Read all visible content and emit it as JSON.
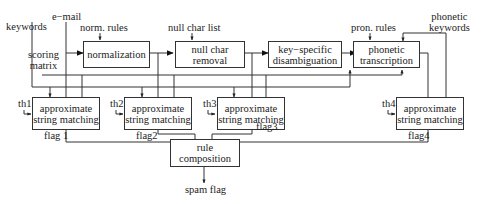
{
  "inputs": {
    "keywords": "keywords",
    "email": "e−mail",
    "scoring_matrix_line1": "scoring",
    "scoring_matrix_line2": "matrix",
    "norm_rules": "norm. rules",
    "null_char_list": "null char list",
    "pron_rules": "pron. rules",
    "phonetic_keywords_line1": "phonetic",
    "phonetic_keywords_line2": "keywords"
  },
  "processing_blocks": {
    "normalization": {
      "line1": "normalization"
    },
    "null_char_removal": {
      "line1": "null char",
      "line2": "removal"
    },
    "disambiguation": {
      "line1": "key−specific",
      "line2": "disambiguation"
    },
    "phonetic_transcription": {
      "line1": "phonetic",
      "line2": "transcription"
    }
  },
  "matchers": [
    {
      "threshold": "th1",
      "line1": "approximate",
      "line2": "string matching",
      "flag": "flag 1"
    },
    {
      "threshold": "th2",
      "line1": "approximate",
      "line2": "string matching",
      "flag": "flag2"
    },
    {
      "threshold": "th3",
      "line1": "approximate",
      "line2": "string matching",
      "flag": "flag3"
    },
    {
      "threshold": "th4",
      "line1": "approximate",
      "line2": "string matching",
      "flag": "flag4"
    }
  ],
  "composition": {
    "line1": "rule",
    "line2": "composition"
  },
  "output": {
    "label": "spam flag"
  }
}
